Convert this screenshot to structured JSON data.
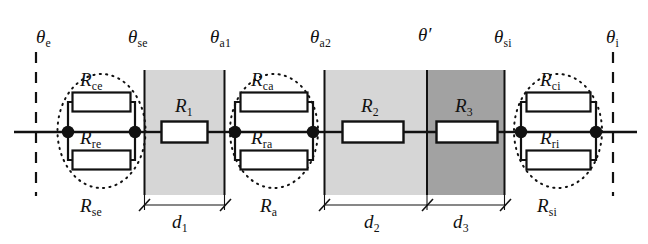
{
  "figure": {
    "type": "thermal-resistance-network-diagram",
    "width": 648,
    "height": 244,
    "background": "#ffffff"
  },
  "colors": {
    "line": "#111111",
    "block_light": "#d6d6d6",
    "block_dark": "#a2a2a2",
    "resistor_fill": "#ffffff",
    "node_fill": "#111111",
    "dashed": "#111111",
    "dotted_ellipse": "#111111"
  },
  "temperature_nodes": [
    {
      "id": "theta-e",
      "label": "θ",
      "sub": "e",
      "x": 44,
      "y": 40
    },
    {
      "id": "theta-se",
      "label": "θ",
      "sub": "se",
      "x": 138,
      "y": 40
    },
    {
      "id": "theta-a1",
      "label": "θ",
      "sub": "a1",
      "x": 220,
      "y": 40
    },
    {
      "id": "theta-a2",
      "label": "θ",
      "sub": "a2",
      "x": 320,
      "y": 40
    },
    {
      "id": "theta-prime",
      "label": "θ′",
      "sub": "",
      "x": 425,
      "y": 40
    },
    {
      "id": "theta-si",
      "label": "θ",
      "sub": "si",
      "x": 503,
      "y": 40
    },
    {
      "id": "theta-i",
      "label": "θ",
      "sub": "i",
      "x": 614,
      "y": 40
    }
  ],
  "resistors": [
    {
      "id": "R-ce",
      "label": "R",
      "sub": "ce",
      "group": "surface-external"
    },
    {
      "id": "R-re",
      "label": "R",
      "sub": "re",
      "group": "surface-external"
    },
    {
      "id": "R-1",
      "label": "R",
      "sub": "1",
      "group": "layer-1"
    },
    {
      "id": "R-ca",
      "label": "R",
      "sub": "ca",
      "group": "air-cavity"
    },
    {
      "id": "R-ra",
      "label": "R",
      "sub": "ra",
      "group": "air-cavity"
    },
    {
      "id": "R-2",
      "label": "R",
      "sub": "2",
      "group": "layer-2"
    },
    {
      "id": "R-3",
      "label": "R",
      "sub": "3",
      "group": "layer-3"
    },
    {
      "id": "R-ci",
      "label": "R",
      "sub": "ci",
      "group": "surface-internal"
    },
    {
      "id": "R-ri",
      "label": "R",
      "sub": "ri",
      "group": "surface-internal"
    }
  ],
  "group_labels": [
    {
      "id": "R-se",
      "label": "R",
      "sub": "se",
      "x": 78,
      "y": 196
    },
    {
      "id": "R-a",
      "label": "R",
      "sub": "a",
      "x": 262,
      "y": 196
    },
    {
      "id": "R-si",
      "label": "R",
      "sub": "si",
      "x": 539,
      "y": 196
    }
  ],
  "dimensions": [
    {
      "id": "d-1",
      "label": "d",
      "sub": "1",
      "x_start": 144,
      "x_end": 225,
      "label_x": 176,
      "label_y": 212
    },
    {
      "id": "d-2",
      "label": "d",
      "sub": "2",
      "x_start": 324,
      "x_end": 427,
      "label_x": 368,
      "label_y": 212
    },
    {
      "id": "d-3",
      "label": "d",
      "sub": "3",
      "x_start": 427,
      "x_end": 505,
      "label_x": 457,
      "label_y": 212
    }
  ],
  "material_blocks": [
    {
      "id": "block-layer-1",
      "x": 144,
      "y": 70,
      "w": 81,
      "h": 125,
      "shade": "light"
    },
    {
      "id": "block-layer-2",
      "x": 324,
      "y": 70,
      "w": 103,
      "h": 125,
      "shade": "light"
    },
    {
      "id": "block-layer-3",
      "x": 427,
      "y": 70,
      "w": 78,
      "h": 125,
      "shade": "dark"
    }
  ],
  "boundary_lines": [
    {
      "id": "boundary-external",
      "x": 36
    },
    {
      "id": "boundary-internal",
      "x": 613
    }
  ]
}
